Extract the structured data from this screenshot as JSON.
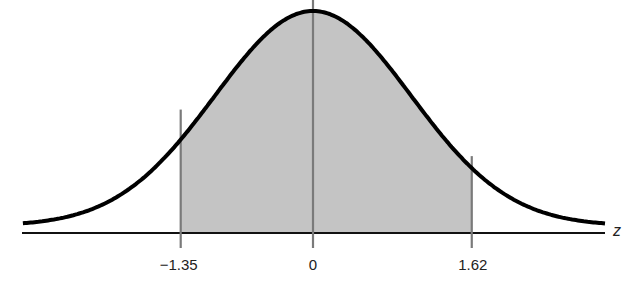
{
  "chart_data": {
    "type": "area",
    "title": "",
    "xlabel": "z",
    "ylabel": "",
    "distribution": "standard normal",
    "mean": 0,
    "sd": 1,
    "shaded_region": {
      "from": -1.35,
      "to": 1.62
    },
    "tick_labels": [
      "−1.35",
      "0",
      "1.62"
    ],
    "tick_values": [
      -1.35,
      0,
      1.62
    ],
    "xlim": [
      -2.96,
      2.98
    ],
    "grid": false,
    "legend": null
  },
  "colors": {
    "curve": "#000000",
    "shade": "#c4c4c4",
    "verticals": "#7a7a7a",
    "axis": "#111111"
  },
  "labels": {
    "axis_variable": "z",
    "tick_left": "−1.35",
    "tick_center": "0",
    "tick_right": "1.62"
  }
}
